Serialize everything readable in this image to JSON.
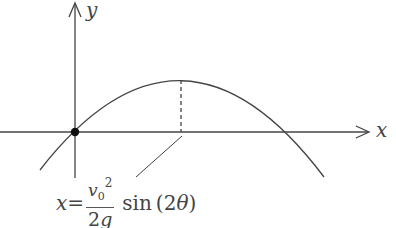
{
  "diagram": {
    "type": "projectile-trajectory",
    "axes": {
      "x_label": "x",
      "y_label": "y"
    },
    "origin_marker": "filled-dot",
    "curve": "downward parabola through origin",
    "peak_marker": "dashed vertical line from peak to x-axis",
    "formula": {
      "lhs": "x",
      "equals": "=",
      "numerator_var": "v",
      "numerator_sub": "0",
      "numerator_sup": "2",
      "denominator_num": "2",
      "denominator_var": "g",
      "function": "sin",
      "argument_open": "(2",
      "argument_var": "θ",
      "argument_close": ")"
    },
    "colors": {
      "stroke": "#444444",
      "background": "#ffffff"
    }
  }
}
